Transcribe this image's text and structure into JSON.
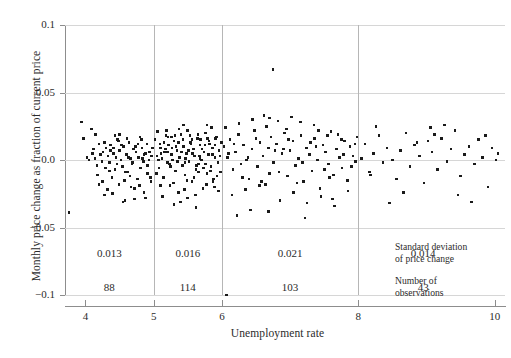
{
  "chart_data": {
    "type": "scatter",
    "title": "",
    "xlabel": "Unemployment rate",
    "ylabel": "Monthly price change as fraction of current price",
    "xlim": [
      3.7,
      10.15
    ],
    "ylim": [
      -0.1,
      0.1
    ],
    "xticks": [
      4,
      5,
      6,
      8,
      10
    ],
    "xtick_labels": [
      "4",
      "5",
      "6",
      "8",
      "10"
    ],
    "yticks": [
      0.1,
      0.05,
      0.0,
      -0.05,
      -0.1
    ],
    "ytick_labels": [
      "0.1",
      "0.05",
      "0.0",
      "−0.05",
      "−0.1"
    ],
    "grid": "horizontal",
    "legend": "none",
    "marker": "square",
    "marker_color": "#1a1a1a",
    "group_dividers": [
      5,
      6,
      8
    ],
    "groups": [
      {
        "range": [
          3.7,
          5
        ],
        "center": 4.35,
        "sd": "0.013",
        "n": "88"
      },
      {
        "range": [
          5,
          6
        ],
        "center": 5.5,
        "sd": "0.016",
        "n": "114"
      },
      {
        "range": [
          6,
          8
        ],
        "center": 7.0,
        "sd": "0.021",
        "n": "103"
      },
      {
        "range": [
          8,
          10.15
        ],
        "center": 8.95,
        "sd": "0.014",
        "n": "43"
      }
    ],
    "annotations": [
      {
        "name": "sd-legend",
        "line1": "Standard deviation",
        "line2": "of price change"
      },
      {
        "name": "n-legend",
        "line1": "Number of",
        "line2": "observations"
      }
    ],
    "points": [
      [
        3.76,
        -0.039
      ],
      [
        3.94,
        0.028
      ],
      [
        3.97,
        0.016
      ],
      [
        4.02,
        0.002
      ],
      [
        4.05,
        0.0
      ],
      [
        4.09,
        0.023
      ],
      [
        4.12,
        0.008
      ],
      [
        4.14,
        0.001
      ],
      [
        4.17,
        -0.004
      ],
      [
        4.2,
        0.012
      ],
      [
        4.22,
        0.004
      ],
      [
        4.24,
        -0.001
      ],
      [
        4.26,
        0.006
      ],
      [
        4.28,
        -0.026
      ],
      [
        4.3,
        0.009
      ],
      [
        4.33,
        0.003
      ],
      [
        4.35,
        -0.002
      ],
      [
        4.37,
        0.011
      ],
      [
        4.39,
        -0.013
      ],
      [
        4.41,
        0.005
      ],
      [
        4.43,
        -0.007
      ],
      [
        4.45,
        0.002
      ],
      [
        4.47,
        0.015
      ],
      [
        4.49,
        -0.018
      ],
      [
        4.5,
        0.007
      ],
      [
        4.52,
        0.0
      ],
      [
        4.54,
        -0.005
      ],
      [
        4.56,
        0.01
      ],
      [
        4.58,
        -0.03
      ],
      [
        4.6,
        0.004
      ],
      [
        4.62,
        -0.009
      ],
      [
        4.64,
        0.013
      ],
      [
        4.66,
        0.001
      ],
      [
        4.68,
        -0.003
      ],
      [
        4.7,
        0.008
      ],
      [
        4.72,
        -0.021
      ],
      [
        4.74,
        0.006
      ],
      [
        4.76,
        -0.014
      ],
      [
        4.78,
        0.002
      ],
      [
        4.8,
        0.017
      ],
      [
        4.81,
        -0.006
      ],
      [
        4.83,
        0.009
      ],
      [
        4.85,
        -0.001
      ],
      [
        4.86,
        0.004
      ],
      [
        4.88,
        -0.028
      ],
      [
        4.9,
        0.012
      ],
      [
        4.91,
        -0.01
      ],
      [
        4.93,
        0.0
      ],
      [
        4.94,
        0.006
      ],
      [
        4.96,
        -0.016
      ],
      [
        4.97,
        0.003
      ],
      [
        4.98,
        0.009
      ],
      [
        4.4,
        -0.025
      ],
      [
        4.55,
        -0.031
      ],
      [
        4.72,
        -0.029
      ],
      [
        4.15,
        0.019
      ],
      [
        4.32,
        -0.022
      ],
      [
        4.48,
        0.014
      ],
      [
        4.65,
        -0.012
      ],
      [
        4.79,
        -0.019
      ],
      [
        4.25,
        -0.016
      ],
      [
        4.43,
        0.018
      ],
      [
        4.61,
        0.016
      ],
      [
        4.86,
        -0.024
      ],
      [
        4.35,
        -0.008
      ],
      [
        4.53,
        0.011
      ],
      [
        4.69,
        -0.002
      ],
      [
        4.88,
        0.005
      ],
      [
        4.18,
        -0.011
      ],
      [
        4.37,
        0.007
      ],
      [
        4.57,
        -0.015
      ],
      [
        4.73,
        0.01
      ],
      [
        4.91,
        -0.004
      ],
      [
        4.28,
        0.013
      ],
      [
        4.46,
        -0.003
      ],
      [
        4.63,
        0.002
      ],
      [
        4.82,
        0.015
      ],
      [
        4.1,
        0.005
      ],
      [
        4.29,
        -0.006
      ],
      [
        4.5,
        0.019
      ],
      [
        4.67,
        -0.02
      ],
      [
        4.84,
        0.001
      ],
      [
        4.2,
        -0.018
      ],
      [
        4.41,
        0.009
      ],
      [
        4.59,
        -0.009
      ],
      [
        4.77,
        0.012
      ],
      [
        4.95,
        -0.013
      ],
      [
        5.02,
        0.015
      ],
      [
        5.05,
        0.003
      ],
      [
        5.08,
        -0.006
      ],
      [
        5.1,
        0.009
      ],
      [
        5.12,
        0.001
      ],
      [
        5.14,
        -0.013
      ],
      [
        5.16,
        0.006
      ],
      [
        5.18,
        0.018
      ],
      [
        5.2,
        -0.002
      ],
      [
        5.22,
        0.011
      ],
      [
        5.24,
        -0.019
      ],
      [
        5.26,
        0.004
      ],
      [
        5.28,
        0.0
      ],
      [
        5.3,
        0.014
      ],
      [
        5.32,
        -0.008
      ],
      [
        5.34,
        0.007
      ],
      [
        5.36,
        -0.024
      ],
      [
        5.38,
        0.002
      ],
      [
        5.4,
        0.019
      ],
      [
        5.42,
        -0.004
      ],
      [
        5.44,
        0.01
      ],
      [
        5.46,
        -0.011
      ],
      [
        5.48,
        0.005
      ],
      [
        5.5,
        0.022
      ],
      [
        5.52,
        -0.001
      ],
      [
        5.54,
        0.013
      ],
      [
        5.56,
        -0.016
      ],
      [
        5.58,
        0.008
      ],
      [
        5.6,
        0.003
      ],
      [
        5.62,
        -0.007
      ],
      [
        5.64,
        0.016
      ],
      [
        5.66,
        -0.003
      ],
      [
        5.68,
        0.011
      ],
      [
        5.7,
        0.0
      ],
      [
        5.72,
        -0.021
      ],
      [
        5.74,
        0.006
      ],
      [
        5.76,
        0.02
      ],
      [
        5.78,
        -0.01
      ],
      [
        5.8,
        0.004
      ],
      [
        5.82,
        0.012
      ],
      [
        5.84,
        -0.005
      ],
      [
        5.86,
        0.009
      ],
      [
        5.88,
        -0.014
      ],
      [
        5.9,
        0.002
      ],
      [
        5.92,
        0.017
      ],
      [
        5.94,
        -0.002
      ],
      [
        5.96,
        0.007
      ],
      [
        5.98,
        -0.009
      ],
      [
        5.99,
        0.013
      ],
      [
        5.06,
        0.021
      ],
      [
        5.13,
        -0.027
      ],
      [
        5.21,
        0.017
      ],
      [
        5.29,
        -0.017
      ],
      [
        5.37,
        0.023
      ],
      [
        5.45,
        -0.022
      ],
      [
        5.53,
        0.018
      ],
      [
        5.61,
        -0.026
      ],
      [
        5.69,
        0.015
      ],
      [
        5.77,
        -0.018
      ],
      [
        5.85,
        0.024
      ],
      [
        5.93,
        -0.012
      ],
      [
        5.09,
        0.012
      ],
      [
        5.17,
        0.008
      ],
      [
        5.25,
        -0.005
      ],
      [
        5.33,
        0.01
      ],
      [
        5.41,
        0.006
      ],
      [
        5.49,
        -0.015
      ],
      [
        5.57,
        0.005
      ],
      [
        5.65,
        0.019
      ],
      [
        5.73,
        -0.006
      ],
      [
        5.81,
        0.014
      ],
      [
        5.89,
        -0.02
      ],
      [
        5.97,
        0.003
      ],
      [
        5.04,
        -0.01
      ],
      [
        5.11,
        0.005
      ],
      [
        5.19,
        0.022
      ],
      [
        5.27,
        0.009
      ],
      [
        5.35,
        -0.001
      ],
      [
        5.43,
        0.015
      ],
      [
        5.51,
        0.007
      ],
      [
        5.59,
        -0.013
      ],
      [
        5.67,
        0.003
      ],
      [
        5.75,
        0.011
      ],
      [
        5.83,
        -0.008
      ],
      [
        5.91,
        0.016
      ],
      [
        5.95,
        -0.023
      ],
      [
        5.07,
        0.0
      ],
      [
        5.15,
        0.013
      ],
      [
        5.23,
        -0.003
      ],
      [
        5.31,
        0.018
      ],
      [
        5.39,
        -0.031
      ],
      [
        5.47,
        0.001
      ],
      [
        5.55,
        0.012
      ],
      [
        5.63,
        -0.004
      ],
      [
        5.71,
        0.008
      ],
      [
        5.79,
        0.016
      ],
      [
        5.87,
        -0.016
      ],
      [
        5.3,
        -0.033
      ],
      [
        5.62,
        -0.035
      ],
      [
        5.44,
        0.026
      ],
      [
        5.78,
        0.026
      ],
      [
        5.2,
        0.006
      ],
      [
        5.68,
        0.001
      ],
      [
        5.86,
        0.004
      ],
      [
        5.1,
        -0.019
      ],
      [
        5.5,
        -0.028
      ],
      [
        5.9,
        0.011
      ],
      [
        5.36,
        0.013
      ],
      [
        5.76,
        -0.003
      ],
      [
        5.56,
        0.015
      ],
      [
        5.66,
        -0.009
      ],
      [
        5.46,
        -0.002
      ],
      [
        5.26,
        0.017
      ],
      [
        6.03,
        0.01
      ],
      [
        6.07,
        -0.1
      ],
      [
        6.08,
        0.002
      ],
      [
        6.12,
        0.015
      ],
      [
        6.16,
        -0.007
      ],
      [
        6.2,
        0.006
      ],
      [
        6.24,
        0.019
      ],
      [
        6.28,
        -0.003
      ],
      [
        6.32,
        0.011
      ],
      [
        6.36,
        0.0
      ],
      [
        6.4,
        -0.014
      ],
      [
        6.44,
        0.008
      ],
      [
        6.48,
        0.022
      ],
      [
        6.52,
        -0.005
      ],
      [
        6.56,
        0.013
      ],
      [
        6.6,
        0.003
      ],
      [
        6.64,
        -0.018
      ],
      [
        6.68,
        0.009
      ],
      [
        6.72,
        0.017
      ],
      [
        6.75,
        0.067
      ],
      [
        6.76,
        -0.002
      ],
      [
        6.8,
        0.012
      ],
      [
        6.84,
        -0.009
      ],
      [
        6.88,
        0.005
      ],
      [
        6.92,
        0.02
      ],
      [
        6.96,
        -0.012
      ],
      [
        7.0,
        0.007
      ],
      [
        7.04,
        0.014
      ],
      [
        7.08,
        -0.004
      ],
      [
        7.12,
        0.001
      ],
      [
        7.16,
        0.018
      ],
      [
        7.2,
        -0.016
      ],
      [
        7.24,
        0.009
      ],
      [
        7.28,
        0.004
      ],
      [
        7.32,
        -0.008
      ],
      [
        7.36,
        0.016
      ],
      [
        7.4,
        0.0
      ],
      [
        7.44,
        -0.021
      ],
      [
        7.48,
        0.011
      ],
      [
        7.52,
        0.006
      ],
      [
        7.56,
        -0.003
      ],
      [
        7.6,
        0.021
      ],
      [
        7.64,
        -0.011
      ],
      [
        7.68,
        0.008
      ],
      [
        7.72,
        0.002
      ],
      [
        7.76,
        -0.006
      ],
      [
        7.8,
        0.014
      ],
      [
        7.84,
        -0.015
      ],
      [
        7.88,
        0.01
      ],
      [
        7.92,
        0.003
      ],
      [
        7.96,
        -0.001
      ],
      [
        6.05,
        0.024
      ],
      [
        6.15,
        -0.026
      ],
      [
        6.25,
        0.027
      ],
      [
        6.35,
        -0.022
      ],
      [
        6.45,
        0.03
      ],
      [
        6.55,
        -0.019
      ],
      [
        6.65,
        0.025
      ],
      [
        6.7,
        0.031
      ],
      [
        6.85,
        -0.03
      ],
      [
        6.95,
        0.023
      ],
      [
        7.05,
        -0.024
      ],
      [
        7.15,
        0.028
      ],
      [
        7.25,
        -0.032
      ],
      [
        7.35,
        0.026
      ],
      [
        7.45,
        -0.027
      ],
      [
        7.55,
        0.018
      ],
      [
        7.65,
        -0.034
      ],
      [
        7.75,
        0.015
      ],
      [
        7.85,
        -0.023
      ],
      [
        7.95,
        0.012
      ],
      [
        6.1,
        0.005
      ],
      [
        6.3,
        -0.013
      ],
      [
        6.5,
        0.016
      ],
      [
        6.7,
        -0.01
      ],
      [
        6.9,
        0.008
      ],
      [
        7.1,
        -0.017
      ],
      [
        7.3,
        0.013
      ],
      [
        7.5,
        -0.007
      ],
      [
        7.7,
        0.019
      ],
      [
        7.9,
        -0.005
      ],
      [
        6.18,
        0.012
      ],
      [
        6.38,
        0.002
      ],
      [
        6.58,
        -0.016
      ],
      [
        6.78,
        0.007
      ],
      [
        6.98,
        0.015
      ],
      [
        7.18,
        -0.002
      ],
      [
        7.38,
        0.01
      ],
      [
        7.58,
        -0.013
      ],
      [
        7.78,
        0.004
      ],
      [
        7.98,
        0.017
      ],
      [
        6.42,
        -0.037
      ],
      [
        6.62,
        0.033
      ],
      [
        7.22,
        -0.043
      ],
      [
        7.42,
        0.022
      ],
      [
        6.22,
        -0.041
      ],
      [
        6.82,
        0.029
      ],
      [
        7.62,
        -0.029
      ],
      [
        7.02,
        0.032
      ],
      [
        6.68,
        -0.038
      ],
      [
        8.05,
        0.001
      ],
      [
        8.1,
        0.012
      ],
      [
        8.16,
        -0.009
      ],
      [
        8.22,
        0.005
      ],
      [
        8.3,
        0.018
      ],
      [
        8.36,
        -0.002
      ],
      [
        8.42,
        0.009
      ],
      [
        8.5,
        0.0
      ],
      [
        8.56,
        -0.014
      ],
      [
        8.62,
        0.007
      ],
      [
        8.7,
        0.02
      ],
      [
        8.76,
        -0.005
      ],
      [
        8.82,
        0.011
      ],
      [
        8.9,
        0.003
      ],
      [
        8.96,
        -0.017
      ],
      [
        9.02,
        0.014
      ],
      [
        9.08,
        0.006
      ],
      [
        9.16,
        -0.007
      ],
      [
        9.22,
        0.016
      ],
      [
        9.3,
        -0.001
      ],
      [
        9.36,
        0.008
      ],
      [
        9.42,
        0.022
      ],
      [
        9.5,
        -0.012
      ],
      [
        9.56,
        0.004
      ],
      [
        9.62,
        0.01
      ],
      [
        9.7,
        -0.003
      ],
      [
        9.76,
        0.015
      ],
      [
        9.82,
        0.002
      ],
      [
        9.9,
        -0.02
      ],
      [
        9.96,
        0.009
      ],
      [
        10.02,
        0.0
      ],
      [
        10.05,
        0.005
      ],
      [
        8.26,
        0.025
      ],
      [
        8.66,
        -0.024
      ],
      [
        9.06,
        0.024
      ],
      [
        9.46,
        -0.026
      ],
      [
        9.86,
        0.018
      ],
      [
        8.46,
        -0.032
      ],
      [
        9.26,
        0.026
      ],
      [
        9.66,
        -0.031
      ],
      [
        8.86,
        0.013
      ],
      [
        8.18,
        -0.011
      ],
      [
        9.12,
        0.019
      ]
    ]
  }
}
